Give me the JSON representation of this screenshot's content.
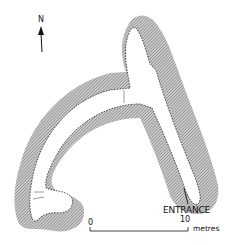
{
  "map": {
    "type": "cave plan",
    "north_label": "N",
    "entrance_label": "ENTRANCE",
    "scale": {
      "start_label": "0",
      "end_label": "10",
      "unit_label": "metres"
    },
    "colors": {
      "hatch": "#8a8a8a",
      "outline": "#111111",
      "background": "#ffffff"
    }
  }
}
